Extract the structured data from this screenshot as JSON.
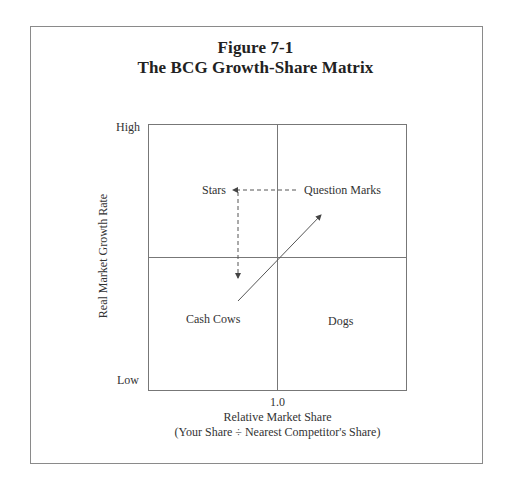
{
  "figure": {
    "number_label": "Figure 7-1",
    "title": "The BCG Growth-Share Matrix"
  },
  "axes": {
    "y": {
      "label": "Real Market Growth Rate",
      "high_label": "High",
      "low_label": "Low"
    },
    "x": {
      "tick_label": "1.0",
      "label": "Relative Market Share",
      "sublabel": "(Your Share ÷ Nearest Competitor's Share)"
    }
  },
  "quadrants": {
    "top_left": "Stars",
    "top_right": "Question Marks",
    "bottom_left": "Cash Cows",
    "bottom_right": "Dogs"
  },
  "arrows": [
    {
      "name": "question-marks-to-stars",
      "style": "dashed",
      "direction": "left"
    },
    {
      "name": "stars-to-cash-cows",
      "style": "dashed",
      "direction": "down"
    },
    {
      "name": "cash-cows-to-question-marks",
      "style": "solid",
      "direction": "up-right"
    }
  ],
  "colors": {
    "line": "#777777",
    "text": "#333333",
    "frame": "#8a8a8a"
  }
}
